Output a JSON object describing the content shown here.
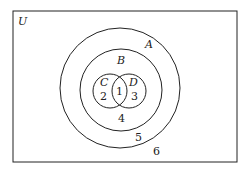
{
  "diagram": {
    "type": "venn",
    "universe_label": "U",
    "sets": [
      {
        "name": "A",
        "label": "A"
      },
      {
        "name": "B",
        "label": "B"
      },
      {
        "name": "C",
        "label": "C"
      },
      {
        "name": "D",
        "label": "D"
      }
    ],
    "regions": [
      {
        "id": "C∩D",
        "label": "1"
      },
      {
        "id": "C only",
        "label": "2"
      },
      {
        "id": "D only",
        "label": "3"
      },
      {
        "id": "B only",
        "label": "4"
      },
      {
        "id": "A only",
        "label": "5"
      },
      {
        "id": "outside A",
        "label": "6"
      }
    ]
  }
}
